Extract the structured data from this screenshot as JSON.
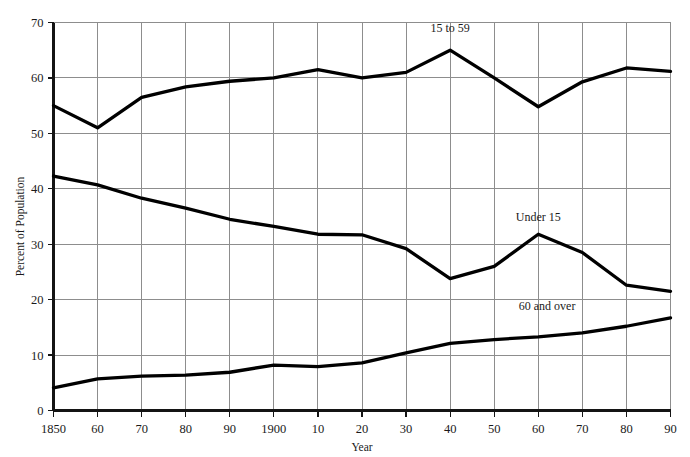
{
  "chart_data": {
    "type": "line",
    "title": "",
    "xlabel": "Year",
    "ylabel": "Percent of Population",
    "xlim": [
      1850,
      1990
    ],
    "ylim": [
      0,
      70
    ],
    "grid": true,
    "legend_position": "inline-labels",
    "x": [
      1850,
      1860,
      1870,
      1880,
      1890,
      1900,
      1910,
      1920,
      1930,
      1940,
      1950,
      1960,
      1970,
      1980,
      1990
    ],
    "xtick_labels": [
      "1850",
      "60",
      "70",
      "80",
      "90",
      "1900",
      "10",
      "20",
      "30",
      "40",
      "50",
      "60",
      "70",
      "80",
      "90"
    ],
    "ytick_labels": [
      "0",
      "10",
      "20",
      "30",
      "40",
      "50",
      "60",
      "70"
    ],
    "ytick_values": [
      0,
      10,
      20,
      30,
      40,
      50,
      60,
      70
    ],
    "series": [
      {
        "name": "15 to 59",
        "label": "15 to 59",
        "color": "#000000",
        "label_x": 1940,
        "label_y": 68.2,
        "values": [
          55.0,
          51.0,
          56.5,
          58.4,
          59.4,
          60.0,
          61.5,
          60.0,
          61.0,
          65.0,
          60.0,
          54.8,
          59.3,
          61.8,
          61.2
        ]
      },
      {
        "name": "Under 15",
        "label": "Under 15",
        "color": "#000000",
        "label_x": 1960,
        "label_y": 34.2,
        "values": [
          42.3,
          40.7,
          38.3,
          36.5,
          34.5,
          33.2,
          31.8,
          31.7,
          29.2,
          23.8,
          26.0,
          31.8,
          28.5,
          22.6,
          21.5
        ]
      },
      {
        "name": "60 and over",
        "label": "60 and over",
        "color": "#000000",
        "label_x": 1962,
        "label_y": 18.2,
        "values": [
          4.1,
          5.7,
          6.2,
          6.4,
          6.9,
          8.2,
          7.9,
          8.6,
          10.4,
          12.1,
          12.8,
          13.3,
          14.0,
          15.2,
          16.7
        ]
      }
    ]
  }
}
